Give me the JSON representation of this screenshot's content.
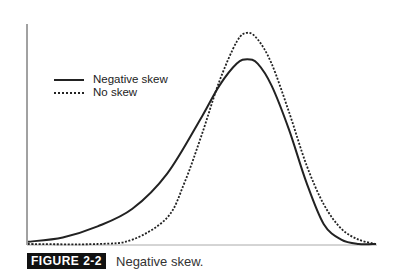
{
  "chart_data": {
    "type": "line",
    "title": "Negative skew.",
    "figure_label": "FIGURE 2-2",
    "xlabel": "",
    "ylabel": "",
    "grid": false,
    "legend_position": "upper-left",
    "series": [
      {
        "name": "Negative skew",
        "style": "solid",
        "description": "left-skewed density, long left tail, peak at ~0.63 of x-range, peak height ~0.84 of y-range",
        "points": [
          [
            0,
            0.01
          ],
          [
            0.1,
            0.03
          ],
          [
            0.2,
            0.08
          ],
          [
            0.3,
            0.16
          ],
          [
            0.4,
            0.32
          ],
          [
            0.5,
            0.58
          ],
          [
            0.55,
            0.72
          ],
          [
            0.6,
            0.82
          ],
          [
            0.63,
            0.84
          ],
          [
            0.66,
            0.82
          ],
          [
            0.7,
            0.72
          ],
          [
            0.75,
            0.52
          ],
          [
            0.8,
            0.28
          ],
          [
            0.85,
            0.09
          ],
          [
            0.9,
            0.02
          ],
          [
            0.95,
            0.0
          ],
          [
            1.0,
            0.0
          ]
        ]
      },
      {
        "name": "No skew",
        "style": "dotted",
        "description": "symmetric normal density, peak at ~0.63 of x-range, peak height ~0.96 of y-range",
        "points": [
          [
            0,
            0.0
          ],
          [
            0.2,
            0.0
          ],
          [
            0.3,
            0.02
          ],
          [
            0.4,
            0.12
          ],
          [
            0.45,
            0.28
          ],
          [
            0.5,
            0.5
          ],
          [
            0.55,
            0.74
          ],
          [
            0.6,
            0.92
          ],
          [
            0.63,
            0.96
          ],
          [
            0.66,
            0.93
          ],
          [
            0.7,
            0.82
          ],
          [
            0.75,
            0.6
          ],
          [
            0.8,
            0.36
          ],
          [
            0.85,
            0.18
          ],
          [
            0.9,
            0.07
          ],
          [
            0.95,
            0.02
          ],
          [
            1.0,
            0.0
          ]
        ]
      }
    ]
  },
  "legend": {
    "items": [
      {
        "label": "Negative skew",
        "style": "solid"
      },
      {
        "label": "No skew",
        "style": "dotted"
      }
    ]
  },
  "caption": {
    "label": "FIGURE 2-2",
    "title": "Negative skew."
  }
}
